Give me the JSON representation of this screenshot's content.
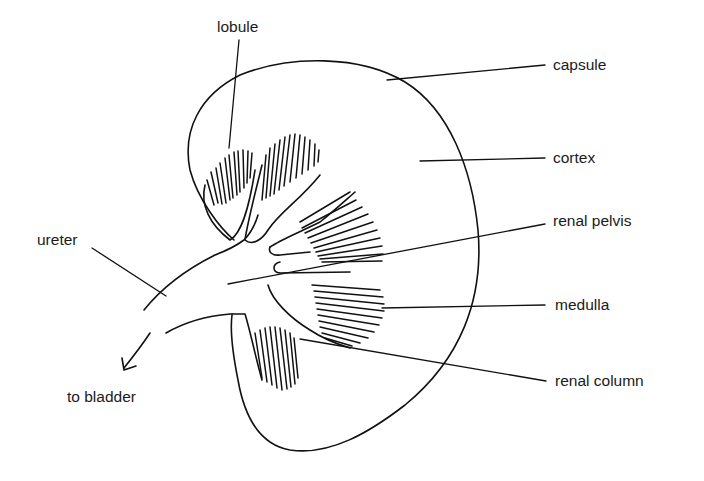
{
  "figure": {
    "background": "#ffffff",
    "ink_color": "#111111"
  },
  "labels": {
    "lobule": "lobule",
    "capsule": "capsule",
    "cortex": "cortex",
    "renal_pelvis": "renal pelvis",
    "ureter": "ureter",
    "medulla": "medulla",
    "to_bladder": "to bladder",
    "renal_column": "renal column"
  }
}
